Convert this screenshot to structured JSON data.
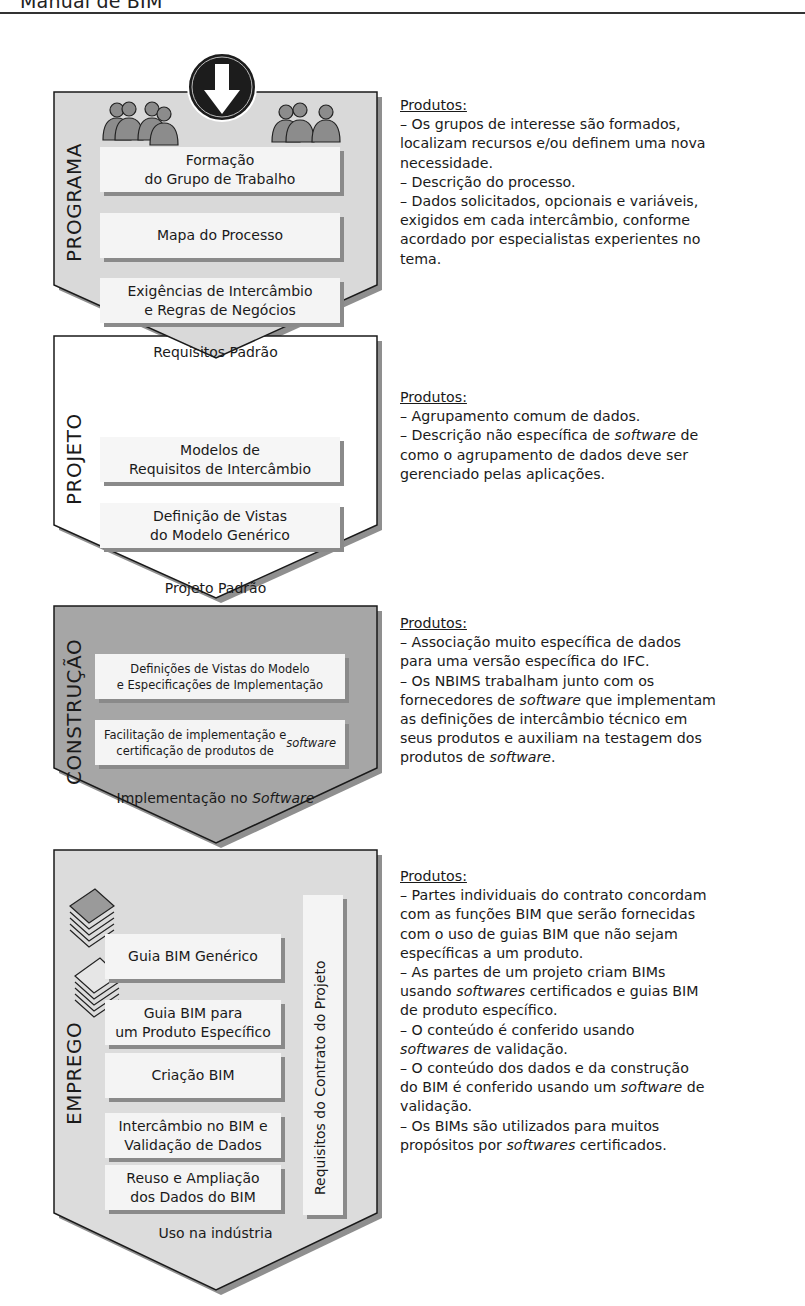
{
  "header": {
    "title": "Manual de BIM"
  },
  "colors": {
    "programa_fill": "#d9d9d9",
    "projeto_fill": "#ffffff",
    "construcao_fill": "#a6a6a6",
    "emprego_fill": "#dcdcdc",
    "box_fill": "#f4f4f4",
    "shadow": "#8a8a8a",
    "outline": "#1a1a1a"
  },
  "stages": [
    {
      "name": "PROGRAMA",
      "boxes": [
        "Formação\ndo Grupo de Trabalho",
        "Mapa do Processo",
        "Exigências de Intercâmbio\ne Regras de Negócios"
      ],
      "footer": "Requisitos Padrão",
      "icons": [
        "people-group-icon",
        "down-arrow-icon",
        "people-group-icon"
      ]
    },
    {
      "name": "PROJETO",
      "boxes": [
        "Modelos de\nRequisitos de Intercâmbio",
        "Definição de Vistas\ndo Modelo Genérico"
      ],
      "footer": "Projeto Padrão"
    },
    {
      "name": "CONSTRUÇÃO",
      "boxes": [
        "Definições de Vistas do Modelo\ne Especificações de Implementação",
        "Facilitação de implementação e\ncertificação de produtos de software"
      ],
      "footer": "Implementação no Software"
    },
    {
      "name": "EMPREGO",
      "boxes": [
        "Guia BIM Genérico",
        "Guia BIM para\num Produto Específico",
        "Criação BIM",
        "Intercâmbio no BIM e\nValidação de Dados",
        "Reuso e Ampliação\ndos Dados do BIM"
      ],
      "side_box": "Requisitos do Contrato do Projeto",
      "footer": "Uso na indústria",
      "icons": [
        "document-stack-icon",
        "document-stack-icon"
      ]
    }
  ],
  "descriptions": [
    {
      "title": "Produtos:",
      "lines": [
        "– Os grupos de interesse são formados,",
        "localizam recursos e/ou definem uma nova",
        "necessidade.",
        "– Descrição do processo.",
        "– Dados solicitados, opcionais e variáveis,",
        "exigidos em cada intercâmbio, conforme",
        "acordado por especialistas experientes no",
        "tema."
      ]
    },
    {
      "title": "Produtos:",
      "lines": [
        "– Agrupamento comum de dados.",
        "– Descrição não específica de software de",
        "como o agrupamento de dados deve ser",
        "gerenciado pelas aplicações."
      ]
    },
    {
      "title": "Produtos:",
      "lines": [
        "– Associação muito específica de dados",
        "para uma versão específica do IFC.",
        "– Os NBIMS trabalham junto com os",
        "fornecedores de software que implementam",
        "as definições de intercâmbio técnico em",
        "seus produtos e auxiliam na testagem dos",
        "produtos de software."
      ]
    },
    {
      "title": "Produtos:",
      "lines": [
        "– Partes individuais do contrato concordam",
        "com as funções BIM que serão fornecidas",
        "com o uso de guias BIM que não sejam",
        "específicas a um produto.",
        "– As partes de um projeto criam BIMs",
        "usando softwares certificados e guias BIM",
        "de produto específico.",
        "– O conteúdo é conferido usando",
        "softwares de validação.",
        "– O conteúdo dos dados e da construção",
        "do BIM é conferido usando um software de",
        "validação.",
        "– Os BIMs são utilizados para muitos",
        "propósitos por softwares certificados."
      ]
    }
  ]
}
